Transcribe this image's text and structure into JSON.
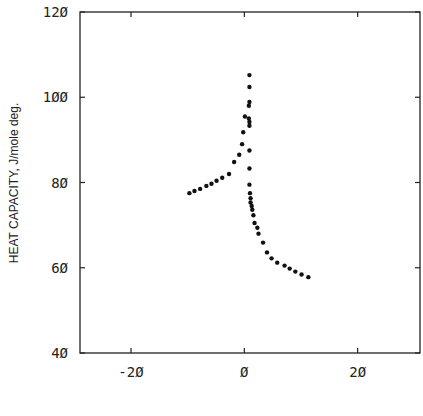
{
  "chart_data": {
    "type": "scatter",
    "title": "",
    "xlabel": "",
    "ylabel": "HEAT CAPACITY, J/mole deg.",
    "xlim": [
      -29,
      31
    ],
    "ylim": [
      40,
      120
    ],
    "xticks": [
      -20,
      0,
      20
    ],
    "xtick_labels": [
      "-2Ø",
      "Ø",
      "2Ø"
    ],
    "yticks": [
      40,
      60,
      80,
      100,
      120
    ],
    "ytick_labels": [
      "4Ø",
      "6Ø",
      "8Ø",
      "1ØØ",
      "12Ø"
    ],
    "grid": false,
    "legend": null,
    "marker_color": "#111111",
    "series": [
      {
        "name": "heat capacity data",
        "points": [
          [
            -9.7,
            77.5
          ],
          [
            -8.8,
            78.0
          ],
          [
            -7.8,
            78.5
          ],
          [
            -6.7,
            79.2
          ],
          [
            -5.8,
            79.7
          ],
          [
            -4.9,
            80.4
          ],
          [
            -3.9,
            81.1
          ],
          [
            -2.7,
            82.0
          ],
          [
            -1.8,
            84.8
          ],
          [
            -0.9,
            86.5
          ],
          [
            -0.4,
            89.0
          ],
          [
            -0.2,
            91.8
          ],
          [
            0.1,
            95.5
          ],
          [
            0.9,
            105.2
          ],
          [
            0.9,
            102.4
          ],
          [
            0.9,
            98.9
          ],
          [
            0.8,
            98.0
          ],
          [
            0.8,
            95.0
          ],
          [
            0.9,
            94.2
          ],
          [
            0.9,
            93.3
          ],
          [
            0.9,
            87.5
          ],
          [
            0.9,
            83.3
          ],
          [
            0.9,
            79.5
          ],
          [
            1.0,
            77.5
          ],
          [
            1.1,
            76.3
          ],
          [
            1.1,
            75.3
          ],
          [
            1.3,
            74.5
          ],
          [
            1.4,
            73.6
          ],
          [
            1.6,
            72.3
          ],
          [
            1.8,
            70.5
          ],
          [
            2.3,
            69.4
          ],
          [
            2.5,
            68.0
          ],
          [
            3.3,
            65.9
          ],
          [
            4.0,
            63.6
          ],
          [
            4.8,
            62.2
          ],
          [
            5.8,
            61.2
          ],
          [
            7.1,
            60.5
          ],
          [
            8.0,
            59.8
          ],
          [
            9.0,
            59.1
          ],
          [
            10.1,
            58.4
          ],
          [
            11.3,
            57.8
          ]
        ]
      }
    ]
  }
}
